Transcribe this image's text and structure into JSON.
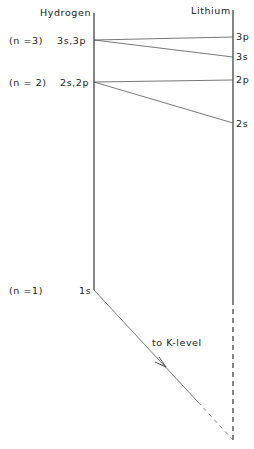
{
  "diagram": {
    "columns": {
      "hydrogen": {
        "title": "Hydrogen"
      },
      "lithium": {
        "title": "Lithium"
      }
    },
    "hydrogen_levels": [
      {
        "n_label": "(n =3)",
        "level_label": "3s,3p"
      },
      {
        "n_label": "(n = 2)",
        "level_label": "2s,2p"
      },
      {
        "n_label": "(n =1)",
        "level_label": "1s"
      }
    ],
    "lithium_levels": [
      {
        "label": "3p"
      },
      {
        "label": "3s"
      },
      {
        "label": "2p"
      },
      {
        "label": "2s"
      }
    ],
    "transition": {
      "label": "to K-level"
    },
    "colors": {
      "line": "#333333",
      "text": "#222222",
      "background": "#ffffff"
    }
  }
}
